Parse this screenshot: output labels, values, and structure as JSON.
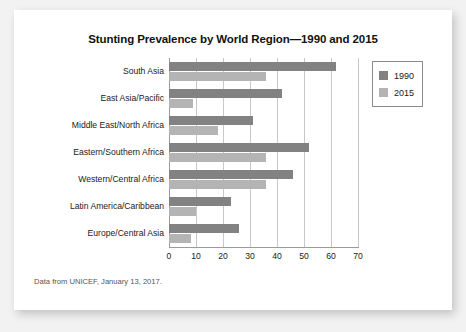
{
  "chart_data": {
    "type": "bar",
    "orientation": "horizontal",
    "title": "Stunting Prevalence by World Region—1990 and 2015",
    "xlabel": "",
    "ylabel": "",
    "xlim": [
      0,
      70
    ],
    "xticks": [
      0,
      10,
      20,
      30,
      40,
      50,
      60,
      70
    ],
    "grid": true,
    "legend_position": "upper-right",
    "categories": [
      "South Asia",
      "East Asia/Pacific",
      "Middle East/North Africa",
      "Eastern/Southern Africa",
      "Western/Central Africa",
      "Latin America/Caribbean",
      "Europe/Central Asia"
    ],
    "series": [
      {
        "name": "1990",
        "color": "#828282",
        "values": [
          62,
          42,
          31,
          52,
          46,
          23,
          26
        ]
      },
      {
        "name": "2015",
        "color": "#b4b4b4",
        "values": [
          36,
          9,
          18,
          36,
          36,
          10,
          8
        ]
      }
    ]
  },
  "source_note": "Data from UNICEF, January 13, 2017."
}
